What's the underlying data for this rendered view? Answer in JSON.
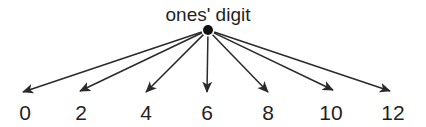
{
  "diagram": {
    "kind": "fan-out-arrow-diagram",
    "background_color": "#ffffff",
    "ink_color": "#1f1f1f",
    "title": "ones' digit",
    "node": {
      "label": "ones'-digit-node",
      "x": 208,
      "y": 30,
      "radius": 5,
      "color": "#111111"
    },
    "title_position": {
      "x": 208,
      "y": 21
    },
    "leaves": [
      {
        "label": "0",
        "tip_x": 23,
        "tip_y": 92,
        "text_x": 25,
        "text_y": 120
      },
      {
        "label": "2",
        "tip_x": 80,
        "tip_y": 91,
        "text_x": 81,
        "text_y": 120
      },
      {
        "label": "4",
        "tip_x": 146,
        "tip_y": 92,
        "text_x": 146,
        "text_y": 120
      },
      {
        "label": "6",
        "tip_x": 207,
        "tip_y": 92,
        "text_x": 207,
        "text_y": 120
      },
      {
        "label": "8",
        "tip_x": 268,
        "tip_y": 92,
        "text_x": 268,
        "text_y": 120
      },
      {
        "label": "10",
        "tip_x": 333,
        "tip_y": 90,
        "text_x": 331,
        "text_y": 120
      },
      {
        "label": "12",
        "tip_x": 390,
        "tip_y": 91,
        "text_x": 393,
        "text_y": 120
      }
    ]
  }
}
